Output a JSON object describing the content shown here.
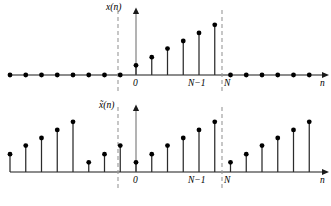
{
  "figure": {
    "title": "",
    "axis_label_x": "n",
    "panels": [
      {
        "id": "top",
        "signal_label": "x(n)",
        "tick_zero": "0",
        "tick_nminus1": "N−1",
        "tick_n": "N",
        "axis_label": "n"
      },
      {
        "id": "bottom",
        "signal_label": "x̃(n)",
        "tick_zero": "0",
        "tick_nminus1": "N−1",
        "tick_n": "N",
        "axis_label": "n"
      }
    ]
  },
  "colors": {
    "ink": "#000000",
    "axis": "#1a1a1a",
    "stem": "#2b2b2b",
    "dashed": "#999999",
    "background": "#ffffff"
  },
  "chart_data": [
    {
      "type": "line",
      "id": "top-stem-plot",
      "title": "x(n)",
      "xlabel": "n",
      "ylabel": "x(n)",
      "grid": false,
      "legend": null,
      "xlim": [
        -8,
        13
      ],
      "ylim": [
        0,
        1.05
      ],
      "annotations": [
        "0",
        "N−1",
        "N"
      ],
      "markers": [
        "dashed vertical at n=0",
        "dashed vertical at n=N"
      ],
      "x": [
        -8,
        -7,
        -6,
        -5,
        -4,
        -3,
        -2,
        -1,
        0,
        1,
        2,
        3,
        4,
        5,
        6,
        7,
        8,
        9,
        10,
        11,
        12,
        13
      ],
      "values": [
        0,
        0,
        0,
        0,
        0,
        0,
        0,
        0,
        0.18,
        0.33,
        0.49,
        0.63,
        0.78,
        0.93,
        0,
        0,
        0,
        0,
        0,
        0,
        0,
        0
      ]
    },
    {
      "type": "line",
      "id": "bottom-stem-plot",
      "title": "x̃(n)",
      "xlabel": "n",
      "ylabel": "x̃(n)",
      "grid": false,
      "legend": null,
      "xlim": [
        -8,
        13
      ],
      "ylim": [
        0,
        1.05
      ],
      "annotations": [
        "0",
        "N−1",
        "N"
      ],
      "markers": [
        "dashed vertical at n=0",
        "dashed vertical at n=N"
      ],
      "x": [
        -8,
        -7,
        -6,
        -5,
        -4,
        -3,
        -2,
        -1,
        0,
        1,
        2,
        3,
        4,
        5,
        6,
        7,
        8,
        9,
        10,
        11,
        12,
        13
      ],
      "values": [
        0.33,
        0.49,
        0.63,
        0.78,
        0.93,
        0.18,
        0.33,
        0.49,
        0.18,
        0.33,
        0.49,
        0.63,
        0.78,
        0.93,
        0.18,
        0.33,
        0.49,
        0.63,
        0.78,
        0.93,
        0.18,
        0.33
      ]
    }
  ]
}
